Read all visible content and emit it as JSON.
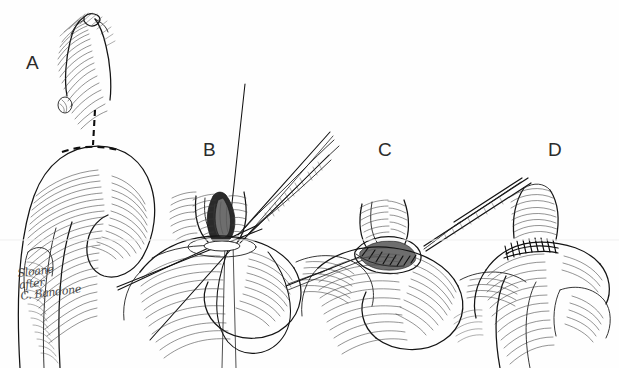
{
  "figure": {
    "kind": "surgical-line-illustration",
    "title": "",
    "background_color": "#fefefe",
    "ink_color": "#1c1c1c",
    "panel_count": 4,
    "panels": [
      {
        "id": "A",
        "label": "A",
        "caption": "",
        "description": "Proximal graft conduit apposed to the aortic arch with dashed incision lines marking the planned arteriotomy; a small vessel loop encircles the conduit.",
        "features": [
          "graft-conduit",
          "aortic-arch",
          "dashed-incision-line",
          "vessel-loop",
          "branch-vessels",
          "hatched-shading"
        ]
      },
      {
        "id": "B",
        "label": "B",
        "caption": "",
        "description": "Opened arteriotomy held by forceps with multiple traction suture threads converging; a long suture loop hangs below the field.",
        "features": [
          "forceps",
          "traction-sutures",
          "suture-loop",
          "open-arteriotomy",
          "everted-graft-edge"
        ]
      },
      {
        "id": "C",
        "label": "C",
        "caption": "",
        "description": "Running continuous suture being placed along the posterior anastomotic rim with a needle holder entering from the upper right.",
        "features": [
          "needle-holder",
          "running-suture",
          "anastomotic-rim",
          "suture-bites"
        ]
      },
      {
        "id": "D",
        "label": "D",
        "caption": "",
        "description": "Completed end-to-side anastomosis showing the finished interrupted suture line across the junction.",
        "features": [
          "completed-anastomosis",
          "suture-line",
          "stitch-marks",
          "graft-limb"
        ]
      }
    ],
    "signature": {
      "present": true,
      "location": "lower-left",
      "text": "Sloane\nafter\nC. Bandone",
      "style": "handwritten-cursive"
    }
  }
}
